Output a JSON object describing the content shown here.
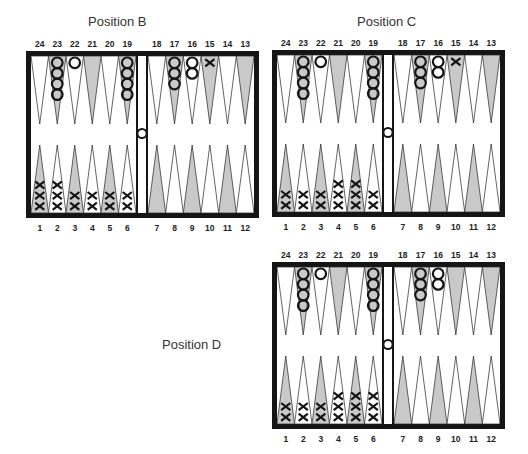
{
  "colors": {
    "frame": "#151515",
    "dark_point": "#c9c9c9",
    "light_point": "#ffffff",
    "checker_stroke": "#151515"
  },
  "top_numbers_left": [
    "24",
    "23",
    "22",
    "21",
    "20",
    "19"
  ],
  "top_numbers_right": [
    "18",
    "17",
    "16",
    "15",
    "14",
    "13"
  ],
  "bottom_numbers_left": [
    "1",
    "2",
    "3",
    "4",
    "5",
    "6"
  ],
  "bottom_numbers_right": [
    "7",
    "8",
    "9",
    "10",
    "11",
    "12"
  ],
  "positions": [
    {
      "id": "B",
      "title": "Position B",
      "x": 26,
      "y": 51,
      "title_x": 88,
      "title_y": 14,
      "o_checkers": {
        "23": 4,
        "22": 1,
        "19": 4,
        "17": 3,
        "16": 2
      },
      "x_checkers": {
        "1": 3,
        "2": 3,
        "3": 2,
        "4": 2,
        "5": 2,
        "6": 2,
        "15": 1
      },
      "o_on_bar": 1
    },
    {
      "id": "C",
      "title": "Position C",
      "x": 272,
      "y": 50,
      "title_x": 357,
      "title_y": 14,
      "o_checkers": {
        "23": 4,
        "22": 1,
        "19": 4,
        "17": 3,
        "16": 2
      },
      "x_checkers": {
        "1": 2,
        "2": 2,
        "3": 2,
        "4": 3,
        "5": 3,
        "6": 2,
        "15": 1
      },
      "o_on_bar": 1
    },
    {
      "id": "D",
      "title": "Position D",
      "x": 272,
      "y": 262,
      "title_x": 162,
      "title_y": 337,
      "o_checkers": {
        "23": 4,
        "22": 1,
        "19": 4,
        "17": 3,
        "16": 2
      },
      "x_checkers": {
        "1": 2,
        "2": 2,
        "3": 2,
        "4": 3,
        "5": 3,
        "6": 3
      },
      "o_on_bar": 1
    }
  ]
}
